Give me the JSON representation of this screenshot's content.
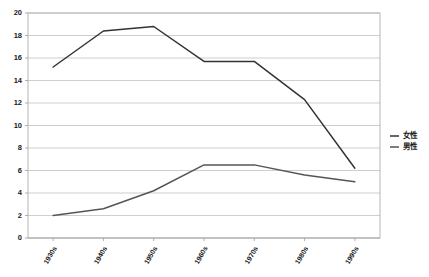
{
  "chart_data": {
    "type": "line",
    "title": "",
    "xlabel": "",
    "ylabel": "",
    "categories": [
      "1930s",
      "1940s",
      "1950s",
      "1960s",
      "1970s",
      "1980s",
      "1990s"
    ],
    "ylim": [
      0,
      20
    ],
    "ytick_step": 2,
    "yticks": [
      "0",
      "2",
      "4",
      "6",
      "8",
      "10",
      "12",
      "14",
      "16",
      "18",
      "20"
    ],
    "grid": true,
    "legend_position": "right",
    "series": [
      {
        "name": "女性",
        "color": "#333333",
        "values": [
          15.2,
          18.4,
          18.8,
          15.7,
          15.7,
          12.3,
          6.2
        ]
      },
      {
        "name": "男性",
        "color": "#555555",
        "values": [
          2.0,
          2.6,
          4.2,
          6.5,
          6.5,
          5.6,
          5.0
        ]
      }
    ]
  },
  "legend": {
    "items": [
      {
        "label": "女性"
      },
      {
        "label": "男性"
      }
    ]
  }
}
